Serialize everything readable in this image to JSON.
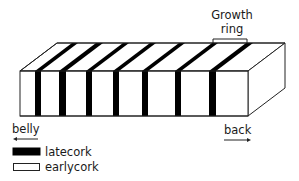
{
  "diagram": {
    "title_label": {
      "line1": "Growth",
      "line2": "ring"
    },
    "direction_labels": {
      "left": "belly",
      "right": "back"
    },
    "legend": [
      {
        "label": "latecork",
        "color": "#000000"
      },
      {
        "label": "earlycork",
        "color": "#ffffff"
      }
    ],
    "colors": {
      "stroke": "#222222",
      "latecork": "#000000",
      "earlycork": "#ffffff"
    },
    "block": {
      "front_face": {
        "x0": 20,
        "y0": 71,
        "x1": 248,
        "y1": 116
      },
      "depth_offset": {
        "dx": 37,
        "dy": -28
      }
    },
    "latecork_bands_front_x": [
      [
        35,
        41
      ],
      [
        59,
        66
      ],
      [
        86,
        92
      ],
      [
        113,
        119
      ],
      [
        142,
        148
      ],
      [
        175,
        181
      ],
      [
        209,
        216
      ]
    ]
  }
}
